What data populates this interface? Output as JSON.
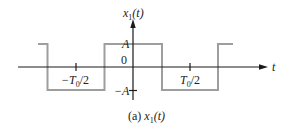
{
  "figure": {
    "y_axis_label": {
      "var": "x",
      "sub": "1",
      "arg": "(t)"
    },
    "x_axis_label": "t",
    "level_high": "A",
    "level_zero": "0",
    "level_low": "−A",
    "tick_neg": {
      "prefix": "−T",
      "sub": "0",
      "suffix": "/2"
    },
    "tick_pos": {
      "prefix": "T",
      "sub": "0",
      "suffix": "/2"
    },
    "caption": {
      "prefix": "(a) ",
      "var": "x",
      "sub": "1",
      "arg": "(t)"
    }
  },
  "colors": {
    "axis": "#1a1a1a",
    "waveform": "#9e9e9e",
    "text": "#222222"
  },
  "waveform": {
    "type": "square-wave",
    "period": "T0",
    "amplitude": "A",
    "description": "even-symmetric square wave: +A for |t| < T0/4, -A for T0/4 < |t| < T0/2"
  }
}
